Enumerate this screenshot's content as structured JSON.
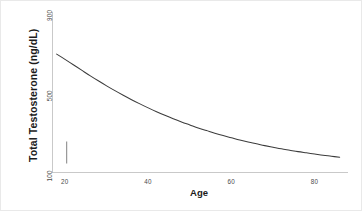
{
  "figure": {
    "background_color": "#ffffff",
    "line_color": "#3c3c3c",
    "axis_color": "#c9c9c9",
    "text_color": "#1b1b1b",
    "tick_text_color": "#4a4a4a"
  },
  "chart_data": {
    "type": "line",
    "title": "",
    "subtitle": "",
    "xlabel": "Age",
    "ylabel": "Total Testosterone (ng/dL)",
    "xlim": [
      17,
      88
    ],
    "ylim": [
      100,
      900
    ],
    "xticks": [
      20,
      40,
      60,
      80
    ],
    "xticklabels": [
      "20",
      "40",
      "60",
      "80"
    ],
    "yticks": [
      100,
      500,
      900
    ],
    "yticklabels": [
      "100",
      "500",
      "900"
    ],
    "grid": false,
    "legend": null,
    "legend_position": "none",
    "series": [
      {
        "name": "Total Testosterone",
        "x": [
          18,
          20,
          22,
          24,
          26,
          28,
          30,
          32,
          34,
          36,
          38,
          40,
          42,
          44,
          46,
          48,
          50,
          52,
          54,
          56,
          58,
          60,
          62,
          64,
          66,
          68,
          70,
          72,
          74,
          76,
          78,
          80,
          82,
          84,
          86
        ],
        "values": [
          690,
          664,
          637,
          610,
          583,
          557,
          532,
          508,
          485,
          463,
          442,
          422,
          403,
          385,
          368,
          352,
          337,
          322,
          309,
          296,
          284,
          273,
          262,
          252,
          243,
          234,
          226,
          218,
          211,
          204,
          198,
          192,
          186,
          181,
          176
        ]
      }
    ],
    "annotations": [
      {
        "name": "reference-bar",
        "type": "vertical-segment",
        "x": 18,
        "y_low": 145,
        "y_high": 255
      }
    ]
  },
  "axes": {
    "y_tick_900": "900",
    "y_tick_500": "500",
    "y_tick_100": "100",
    "x_tick_20": "20",
    "x_tick_40": "40",
    "x_tick_60": "60",
    "x_tick_80": "80",
    "y_title": "Total Testosterone (ng/dL)",
    "x_title": "Age"
  }
}
